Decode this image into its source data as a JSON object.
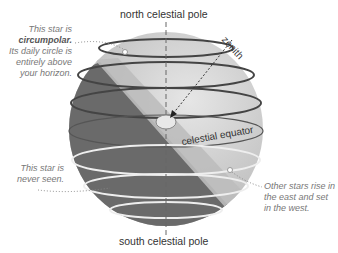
{
  "labels": {
    "north_pole": "north celestial pole",
    "south_pole": "south celestial pole",
    "zenith": "zenith",
    "celestial_equator": "celestial equator"
  },
  "notes": {
    "circumpolar": {
      "line1": "This star is",
      "line2": "circumpolar.",
      "line3": "Its daily circle is",
      "line4": "entirely above",
      "line5": "your horizon."
    },
    "never_seen": {
      "line1": "This star is",
      "line2": "never seen."
    },
    "rise_set": {
      "line1": "Other stars rise in",
      "line2": "the east and set",
      "line3": "in the west."
    }
  },
  "colors": {
    "sphere_light": "#d4d4d4",
    "sphere_dark": "#6e6e6e",
    "horizon_plane": "#bdbdbd",
    "text": "#333333",
    "note_text": "#777777"
  }
}
